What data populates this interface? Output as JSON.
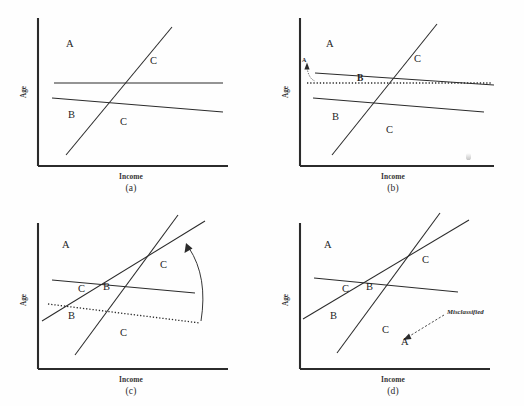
{
  "figure": {
    "title_caption": "",
    "axis": {
      "x_label": "Income",
      "y_label": "Age"
    },
    "colors": {
      "ink": "#2b2b2b",
      "background": "#fefefe",
      "annotation": "#2a2a2a"
    }
  },
  "panels": [
    {
      "id": "a",
      "caption": "(a)",
      "x_label": "Income",
      "y_label": "Age",
      "region_labels": [
        {
          "text": "A",
          "x": 66,
          "y": 45
        },
        {
          "text": "C",
          "x": 150,
          "y": 62
        },
        {
          "text": "B",
          "x": 68,
          "y": 115
        },
        {
          "text": "C",
          "x": 120,
          "y": 122
        }
      ],
      "boundaries": [
        {
          "name": "horizontal-boundary",
          "style": "solid",
          "x1": 54,
          "y1": 83,
          "x2": 223,
          "y2": 83
        },
        {
          "name": "lower-sloping-boundary",
          "style": "solid",
          "x1": 52,
          "y1": 98,
          "x2": 223,
          "y2": 112
        },
        {
          "name": "steep-rising-boundary",
          "style": "solid",
          "x1": 66,
          "y1": 155,
          "x2": 172,
          "y2": 27
        }
      ],
      "annotations": []
    },
    {
      "id": "b",
      "caption": "(b)",
      "x_label": "Income",
      "y_label": "Age",
      "region_labels": [
        {
          "text": "A",
          "x": 64,
          "y": 45
        },
        {
          "text": "C",
          "x": 152,
          "y": 60
        },
        {
          "text": "B",
          "x": 70,
          "y": 117
        },
        {
          "text": "C",
          "x": 124,
          "y": 130
        }
      ],
      "moved_label": {
        "text": "B",
        "x": 95,
        "y": 79
      },
      "boundaries": [
        {
          "name": "old-horizontal-boundary",
          "style": "dotted",
          "x1": 45,
          "y1": 83,
          "x2": 230,
          "y2": 83
        },
        {
          "name": "rotated-upper-boundary",
          "style": "solid",
          "x1": 53,
          "y1": 73,
          "x2": 232,
          "y2": 85
        },
        {
          "name": "lower-sloping-boundary",
          "style": "solid",
          "x1": 51,
          "y1": 98,
          "x2": 222,
          "y2": 112
        },
        {
          "name": "steep-rising-boundary",
          "style": "solid",
          "x1": 70,
          "y1": 155,
          "x2": 175,
          "y2": 24
        }
      ],
      "annotations": [
        {
          "name": "rotation-pointer-a",
          "label": "A",
          "label_x": 42,
          "label_y": 68
        }
      ]
    },
    {
      "id": "c",
      "caption": "(c)",
      "x_label": "Income",
      "y_label": "Age",
      "region_labels": [
        {
          "text": "A",
          "x": 62,
          "y": 43
        },
        {
          "text": "C",
          "x": 160,
          "y": 63
        },
        {
          "text": "C",
          "x": 78,
          "y": 87
        },
        {
          "text": "B",
          "x": 103,
          "y": 85
        },
        {
          "text": "B",
          "x": 68,
          "y": 113
        },
        {
          "text": "C",
          "x": 120,
          "y": 130
        }
      ],
      "boundaries": [
        {
          "name": "upper-sloping-boundary",
          "style": "solid",
          "x1": 52,
          "y1": 77,
          "x2": 195,
          "y2": 90
        },
        {
          "name": "old-lower-boundary",
          "style": "dotted",
          "x1": 48,
          "y1": 101,
          "x2": 200,
          "y2": 120
        },
        {
          "name": "rotated-lower-boundary",
          "style": "solid",
          "x1": 42,
          "y1": 118,
          "x2": 205,
          "y2": 18
        },
        {
          "name": "steep-rising-boundary",
          "style": "solid",
          "x1": 75,
          "y1": 152,
          "x2": 178,
          "y2": 12
        }
      ],
      "annotations": [
        {
          "name": "rotation-arc-arrow",
          "direction": "counterclockwise"
        }
      ]
    },
    {
      "id": "d",
      "caption": "(d)",
      "x_label": "Income",
      "y_label": "Age",
      "region_labels": [
        {
          "text": "A",
          "x": 62,
          "y": 43
        },
        {
          "text": "C",
          "x": 160,
          "y": 58
        },
        {
          "text": "C",
          "x": 80,
          "y": 87
        },
        {
          "text": "B",
          "x": 104,
          "y": 85
        },
        {
          "text": "B",
          "x": 68,
          "y": 113
        },
        {
          "text": "C",
          "x": 120,
          "y": 127
        },
        {
          "text": "A",
          "x": 139,
          "y": 139
        }
      ],
      "boundaries": [
        {
          "name": "upper-sloping-boundary",
          "style": "solid",
          "x1": 52,
          "y1": 75,
          "x2": 196,
          "y2": 89
        },
        {
          "name": "rising-boundary",
          "style": "solid",
          "x1": 41,
          "y1": 116,
          "x2": 207,
          "y2": 17
        },
        {
          "name": "steep-rising-boundary",
          "style": "solid",
          "x1": 75,
          "y1": 150,
          "x2": 178,
          "y2": 10
        }
      ],
      "annotations": [
        {
          "name": "misclassified-annotation",
          "label": "Misclassified",
          "label_x": 185,
          "label_y": 110
        }
      ]
    }
  ]
}
